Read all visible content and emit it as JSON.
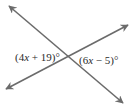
{
  "diagram": {
    "type": "intersecting-lines",
    "line_color": "#6b6b6b",
    "lines": [
      {
        "name": "line-1",
        "from": [
          9,
          6
        ],
        "to": [
          123,
          103
        ],
        "arrows": "both"
      },
      {
        "name": "line-2",
        "from": [
          6,
          89
        ],
        "to": [
          128,
          25
        ],
        "arrows": "both"
      }
    ],
    "intersection": [
      67,
      56
    ],
    "labels": {
      "left_angle": {
        "prefix": "(4",
        "var": "x",
        "suffix": " + 19)°"
      },
      "right_angle": {
        "prefix": "(6",
        "var": "x",
        "suffix": " − 5)°"
      }
    }
  }
}
